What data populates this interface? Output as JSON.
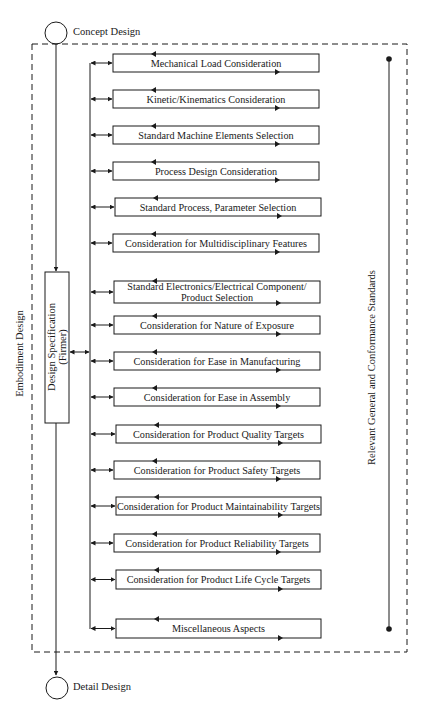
{
  "diagram": {
    "start_node": {
      "label": "Concept Design"
    },
    "end_node": {
      "label": "Detail Design"
    },
    "phase_label": "Embodiment Design",
    "spec_box": {
      "line1": "Design Specification",
      "line2": "(Firmer)"
    },
    "standards_label": "Relevant General and Conformance Standards",
    "considerations": [
      {
        "label": "Mechanical Load Consideration",
        "y": 54,
        "h": 18,
        "x": 113,
        "w": 206
      },
      {
        "label": "Kinetic/Kinematics Consideration",
        "y": 90,
        "h": 18,
        "x": 113,
        "w": 206
      },
      {
        "label": "Standard Machine Elements Selection",
        "y": 126,
        "h": 18,
        "x": 113,
        "w": 206
      },
      {
        "label": "Process Design Consideration",
        "y": 162,
        "h": 18,
        "x": 113,
        "w": 206
      },
      {
        "label": "Standard Process, Parameter Selection",
        "y": 198,
        "h": 18,
        "x": 115,
        "w": 206
      },
      {
        "label": "Consideration for Multidisciplinary Features",
        "y": 234,
        "h": 18,
        "x": 113,
        "w": 206
      },
      {
        "label": "Standard Electronics/Electrical Component/ Product Selection",
        "line1": "Standard Electronics/Electrical Component/",
        "line2": "Product Selection",
        "y": 281,
        "h": 22,
        "x": 114,
        "w": 206
      },
      {
        "label": "Consideration for Nature of Exposure",
        "y": 316,
        "h": 18,
        "x": 114,
        "w": 206
      },
      {
        "label": "Consideration for Ease in Manufacturing",
        "y": 352,
        "h": 18,
        "x": 114,
        "w": 206
      },
      {
        "label": "Consideration for Ease in Assembly",
        "y": 388,
        "h": 18,
        "x": 114,
        "w": 206
      },
      {
        "label": "Consideration for Product Quality Targets",
        "y": 425,
        "h": 18,
        "x": 116,
        "w": 205
      },
      {
        "label": "Consideration for Product Safety Targets",
        "y": 461,
        "h": 18,
        "x": 114,
        "w": 206
      },
      {
        "label": "Consideration for Product Maintainability Targets",
        "y": 497,
        "h": 18,
        "x": 116,
        "w": 205
      },
      {
        "label": "Consideration for Product Reliability Targets",
        "y": 534,
        "h": 18,
        "x": 114,
        "w": 206
      },
      {
        "label": "Consideration for Product Life Cycle Targets",
        "y": 570,
        "h": 19,
        "x": 116,
        "w": 205
      },
      {
        "label": "Miscellaneous Aspects",
        "y": 619,
        "h": 19,
        "x": 116,
        "w": 205
      }
    ],
    "colors": {
      "line": "#1a1a1a",
      "background": "#ffffff"
    }
  }
}
